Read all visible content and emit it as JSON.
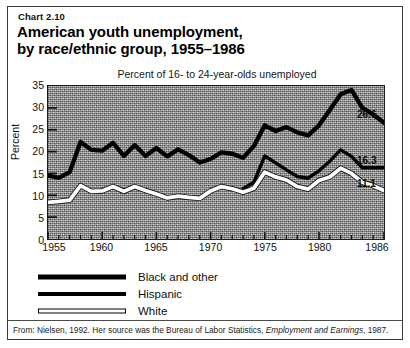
{
  "figure": {
    "chart_number": "Chart 2.10",
    "title_line1": "American youth unemployment,",
    "title_line2": "by race/ethnic group, 1955–1986",
    "source_prefix": "From: Nielsen, 1992. Her source was the Bureau of Labor Statistics, ",
    "source_italic": "Employment and Earnings",
    "source_suffix": ", 1987."
  },
  "legend": {
    "position": "below-plot",
    "items": [
      {
        "label": "Black and other",
        "style": "thick-black-line",
        "color": "#000000"
      },
      {
        "label": "Hispanic",
        "style": "medium-black-line",
        "color": "#000000"
      },
      {
        "label": "White",
        "style": "white-line-black-outline",
        "color": "#ffffff"
      }
    ]
  },
  "callouts": [
    {
      "text": "26.6",
      "series": "Black and other"
    },
    {
      "text": "16.3",
      "series": "Hispanic"
    },
    {
      "text": "11.1",
      "series": "White"
    }
  ],
  "chart_data": {
    "type": "line",
    "title": "American youth unemployment, by race/ethnic group, 1955–1986",
    "subtitle": "Percent of 16- to 24-year-olds unemployed",
    "xlabel": "",
    "ylabel": "Percent",
    "xlim": [
      1955,
      1986
    ],
    "ylim": [
      0,
      35
    ],
    "yticks": [
      0,
      5,
      10,
      15,
      20,
      25,
      30,
      35
    ],
    "ytick_labels": [
      "0",
      "5",
      "10",
      "15",
      "20",
      "25",
      "30",
      "35"
    ],
    "xticks": [
      1955,
      1960,
      1965,
      1970,
      1975,
      1980,
      1986
    ],
    "xtick_labels": [
      "1955",
      "1960",
      "1965",
      "1970",
      "1975",
      "1980",
      "1986"
    ],
    "x_minor_tick_interval": 1,
    "grid": false,
    "plot_background": "gray-noise-texture",
    "series": [
      {
        "name": "Black and other",
        "color": "#000000",
        "line_width": "thick",
        "end_label": "26.6",
        "x": [
          1955,
          1956,
          1957,
          1958,
          1959,
          1960,
          1961,
          1962,
          1963,
          1964,
          1965,
          1966,
          1967,
          1968,
          1969,
          1970,
          1971,
          1972,
          1973,
          1974,
          1975,
          1976,
          1977,
          1978,
          1979,
          1980,
          1981,
          1982,
          1983,
          1984,
          1985,
          1986
        ],
        "values": [
          14.5,
          14.0,
          15.3,
          22.2,
          20.4,
          20.2,
          22.0,
          19.0,
          21.5,
          19.0,
          20.8,
          18.9,
          20.5,
          19.2,
          17.5,
          18.3,
          19.8,
          19.5,
          18.6,
          21.3,
          26.0,
          24.7,
          25.6,
          24.4,
          23.7,
          26.0,
          29.5,
          33.1,
          34.1,
          30.0,
          28.5,
          26.6
        ]
      },
      {
        "name": "Hispanic",
        "color": "#000000",
        "line_width": "medium",
        "end_label": "16.3",
        "x": [
          1973,
          1974,
          1975,
          1976,
          1977,
          1978,
          1979,
          1980,
          1981,
          1982,
          1983,
          1984,
          1985,
          1986
        ],
        "values": [
          11.5,
          13.0,
          19.0,
          17.4,
          15.8,
          14.3,
          13.9,
          15.6,
          17.8,
          20.4,
          18.9,
          16.3,
          16.3,
          16.3
        ]
      },
      {
        "name": "White",
        "color": "#ffffff",
        "line_width": "medium-outlined",
        "end_label": "11.1",
        "x": [
          1955,
          1956,
          1957,
          1958,
          1959,
          1960,
          1961,
          1962,
          1963,
          1964,
          1965,
          1966,
          1967,
          1968,
          1969,
          1970,
          1971,
          1972,
          1973,
          1974,
          1975,
          1976,
          1977,
          1978,
          1979,
          1980,
          1981,
          1982,
          1983,
          1984,
          1985,
          1986
        ],
        "values": [
          8.4,
          8.6,
          8.9,
          12.2,
          10.9,
          11.0,
          12.0,
          10.9,
          12.0,
          11.1,
          10.3,
          9.4,
          9.8,
          9.5,
          9.3,
          11.0,
          12.0,
          11.5,
          10.7,
          11.6,
          15.3,
          14.2,
          13.5,
          12.0,
          11.4,
          13.4,
          14.2,
          16.2,
          15.0,
          13.0,
          12.2,
          11.1
        ]
      }
    ]
  }
}
